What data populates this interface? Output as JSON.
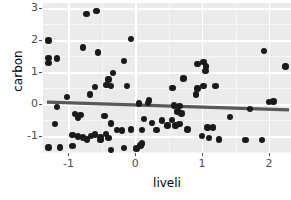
{
  "chart_data": {
    "type": "scatter",
    "title": "",
    "xlabel": "liveli",
    "ylabel": "carbon",
    "xlim": [
      -1.38,
      2.33
    ],
    "ylim": [
      -1.52,
      3.17
    ],
    "xticks": [
      -1,
      0,
      1,
      2
    ],
    "xticklabels": [
      "-1",
      "0",
      "1",
      "2"
    ],
    "yticks": [
      -1,
      0,
      1,
      2,
      3
    ],
    "yticklabels": [
      "-1",
      "0",
      "1",
      "2",
      "3"
    ],
    "grid": true,
    "legend": null,
    "panel_background": "#ebebeb",
    "grid_color": "#ffffff",
    "point_color": "#1a1a1a",
    "point_size": 6.4,
    "fit_line": {
      "type": "linear",
      "color": "#595959",
      "width": 3.2,
      "x_start": -1.32,
      "y_start": 0.07,
      "x_end": 2.3,
      "y_end": -0.17,
      "slope": -0.066,
      "intercept": -0.017
    },
    "points": [
      [
        -0.73,
        2.82
      ],
      [
        -0.58,
        2.92
      ],
      [
        -0.06,
        2.05
      ],
      [
        -1.3,
        2.0
      ],
      [
        -0.78,
        1.78
      ],
      [
        1.93,
        1.67
      ],
      [
        -0.56,
        1.62
      ],
      [
        -1.3,
        1.46
      ],
      [
        -1.17,
        1.44
      ],
      [
        -0.17,
        1.36
      ],
      [
        2.25,
        1.19
      ],
      [
        -1.3,
        1.3
      ],
      [
        0.93,
        1.27
      ],
      [
        1.02,
        1.33
      ],
      [
        1.06,
        1.18
      ],
      [
        1.05,
        1.05
      ],
      [
        -0.33,
        0.98
      ],
      [
        -0.4,
        0.78
      ],
      [
        0.72,
        0.81
      ],
      [
        -0.43,
        0.6
      ],
      [
        -0.36,
        0.58
      ],
      [
        -0.6,
        0.54
      ],
      [
        -0.12,
        0.57
      ],
      [
        0.56,
        0.52
      ],
      [
        0.93,
        0.5
      ],
      [
        1.02,
        0.57
      ],
      [
        1.2,
        0.58
      ],
      [
        -0.68,
        0.31
      ],
      [
        0.91,
        0.31
      ],
      [
        -1.02,
        0.24
      ],
      [
        0.06,
        0.03
      ],
      [
        0.19,
        0.04
      ],
      [
        0.21,
        0.12
      ],
      [
        2.0,
        0.08
      ],
      [
        2.07,
        0.09
      ],
      [
        -1.17,
        -0.08
      ],
      [
        0.58,
        -0.03
      ],
      [
        0.66,
        -0.05
      ],
      [
        1.72,
        -0.15
      ],
      [
        -0.9,
        -0.3
      ],
      [
        -0.82,
        -0.33
      ],
      [
        0.63,
        -0.22
      ],
      [
        0.69,
        -0.28
      ],
      [
        -0.46,
        -0.36
      ],
      [
        -0.86,
        -0.42
      ],
      [
        0.13,
        -0.45
      ],
      [
        0.4,
        -0.5
      ],
      [
        0.55,
        -0.48
      ],
      [
        1.42,
        -0.4
      ],
      [
        -1.2,
        -0.62
      ],
      [
        -0.36,
        -0.6
      ],
      [
        0.25,
        -0.58
      ],
      [
        0.48,
        -0.66
      ],
      [
        0.6,
        -0.66
      ],
      [
        0.66,
        -0.62
      ],
      [
        1.08,
        -0.72
      ],
      [
        -0.27,
        -0.8
      ],
      [
        -0.2,
        -0.82
      ],
      [
        -0.06,
        -0.78
      ],
      [
        0.1,
        -0.8
      ],
      [
        0.32,
        -0.8
      ],
      [
        0.78,
        -0.78
      ],
      [
        1.16,
        -0.72
      ],
      [
        -0.94,
        -0.95
      ],
      [
        -0.86,
        -1.0
      ],
      [
        -0.78,
        -1.04
      ],
      [
        -0.66,
        -0.98
      ],
      [
        -0.6,
        -0.94
      ],
      [
        -0.52,
        -1.02
      ],
      [
        -0.44,
        -0.92
      ],
      [
        -0.72,
        -1.1
      ],
      [
        -0.52,
        -1.12
      ],
      [
        -0.4,
        -1.06
      ],
      [
        1.0,
        -0.98
      ],
      [
        1.1,
        -1.06
      ],
      [
        1.25,
        -1.1
      ],
      [
        1.65,
        -1.12
      ],
      [
        1.9,
        -1.12
      ],
      [
        -1.3,
        -1.35
      ],
      [
        -1.13,
        -1.35
      ],
      [
        -0.94,
        -1.3
      ],
      [
        -0.36,
        -1.42
      ],
      [
        -0.17,
        -1.36
      ],
      [
        0.02,
        -1.38
      ],
      [
        0.08,
        -1.28
      ],
      [
        0.1,
        -1.22
      ]
    ]
  },
  "axes": {
    "xlabel": "liveli",
    "ylabel": "carbon"
  }
}
